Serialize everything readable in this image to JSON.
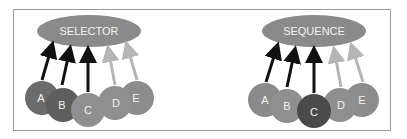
{
  "diagrams": [
    {
      "title": "SELECTOR",
      "nodes": [
        {
          "label": "A",
          "color": "#6b6b6b"
        },
        {
          "label": "B",
          "color": "#5e5e5e"
        },
        {
          "label": "C",
          "color": "#8f8f8f"
        },
        {
          "label": "D",
          "color": "#8f8f8f"
        },
        {
          "label": "E",
          "color": "#8c8c8c"
        }
      ],
      "arrow_colors": [
        "#111111",
        "#111111",
        "#111111",
        "#b5b5b5",
        "#b5b5b5"
      ]
    },
    {
      "title": "SEQUENCE",
      "nodes": [
        {
          "label": "A",
          "color": "#8a8a8a"
        },
        {
          "label": "B",
          "color": "#8f8f8f"
        },
        {
          "label": "C",
          "color": "#4a4a4a"
        },
        {
          "label": "D",
          "color": "#8f8f8f"
        },
        {
          "label": "E",
          "color": "#8c8c8c"
        }
      ],
      "arrow_colors": [
        "#111111",
        "#111111",
        "#111111",
        "#b5b5b5",
        "#b5b5b5"
      ]
    }
  ],
  "colors": {
    "ellipse": "#8a8a8a",
    "frame": "#9a9a9a"
  }
}
